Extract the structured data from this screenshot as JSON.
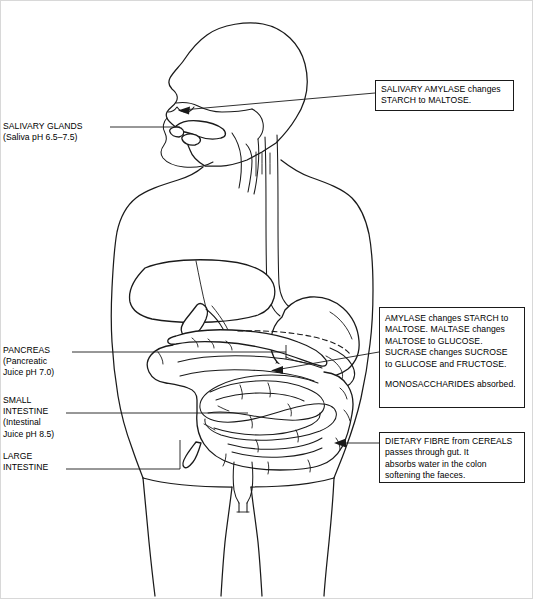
{
  "diagram": {
    "accent_color": "#1a1a1a",
    "background_color": "#ffffff"
  },
  "callouts": [
    {
      "id": "salivary-amylase",
      "text": "SALIVARY AMYLASE changes\nSTARCH to MALTOSE."
    },
    {
      "id": "intestinal-enzymes",
      "text": "AMYLASE changes STARCH to\nMALTOSE. MALTASE changes\nMALTOSE to GLUCOSE.\nSUCRASE changes SUCROSE\nto GLUCOSE and FRUCTOSE.",
      "text2": "MONOSACCHARIDES absorbed."
    },
    {
      "id": "dietary-fibre",
      "text": "DIETARY FIBRE from CEREALS\npasses through gut. It\nabsorbs water in the colon\nsoftening the faeces."
    }
  ],
  "labels": {
    "salivary_glands": "SALIVARY GLANDS\n(Saliva pH 6.5–7.5)",
    "pancreas": "PANCREAS\n(Pancreatic\nJuice pH 7.0)",
    "small_intestine": "SMALL\nINTESTINE\n(Intestinal\nJuice pH 8.5)",
    "large_intestine": "LARGE\nINTESTINE"
  },
  "organs": {
    "head": "head-profile",
    "mouth": "mouth-and-tongue",
    "oesophagus": "oesophagus",
    "liver": "liver",
    "gallbladder": "gallbladder",
    "stomach": "stomach",
    "pancreas": "pancreas",
    "small_intestine": "small-intestine-coils",
    "large_intestine": "large-intestine-colon",
    "appendix": "appendix",
    "rectum": "rectum"
  }
}
